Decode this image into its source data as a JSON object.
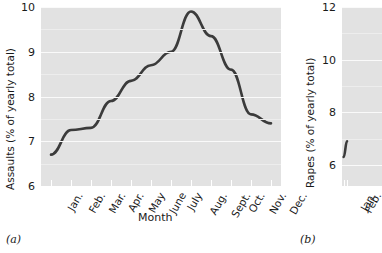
{
  "figure": {
    "background": "#ffffff",
    "plot_background": "#e2e2e2",
    "line_color": "#3b3b3b",
    "gridline_color": "#fafafa"
  },
  "panel_a": {
    "tag": "(a)",
    "ylabel": "Assaults (% of yearly total)",
    "xlabel": "Month",
    "ytick_labels": [
      "10",
      "9",
      "8",
      "7",
      "6"
    ],
    "xtick_labels": [
      "Jan.",
      "Feb.",
      "Mar.",
      "Apr.",
      "May",
      "June",
      "July",
      "Aug.",
      "Sept.",
      "Oct.",
      "Nov.",
      "Dec."
    ]
  },
  "panel_b": {
    "tag": "(b)",
    "ylabel": "Rapes (% of yearly total)",
    "ytick_labels": [
      "12",
      "10",
      "8",
      "6"
    ],
    "xtick_labels": [
      "Jan.",
      "Feb."
    ]
  },
  "chart_data": [
    {
      "type": "line",
      "panel": "(a)",
      "title": "",
      "xlabel": "Month",
      "ylabel": "Assaults (% of yearly total)",
      "categories": [
        "Jan.",
        "Feb.",
        "Mar.",
        "Apr.",
        "May",
        "June",
        "July",
        "Aug.",
        "Sept.",
        "Oct.",
        "Nov.",
        "Dec."
      ],
      "values": [
        6.7,
        7.25,
        7.3,
        7.9,
        8.35,
        8.7,
        9.0,
        9.9,
        9.35,
        8.6,
        7.6,
        7.4
      ],
      "ylim": [
        6,
        10
      ],
      "ytick_values": [
        6,
        7,
        8,
        9,
        10
      ],
      "grid": true,
      "legend": "none",
      "series": [
        {
          "name": "Assaults",
          "values": [
            6.7,
            7.25,
            7.3,
            7.9,
            8.35,
            8.7,
            9.0,
            9.9,
            9.35,
            8.6,
            7.6,
            7.4
          ]
        }
      ]
    },
    {
      "type": "line",
      "panel": "(b)",
      "title": "",
      "xlabel": "",
      "ylabel": "Rapes (% of yearly total)",
      "categories": [
        "Jan.",
        "Feb."
      ],
      "values": [
        6.3,
        6.9
      ],
      "ylim": [
        5.2,
        12
      ],
      "ytick_values": [
        6,
        8,
        10,
        12
      ],
      "grid": true,
      "legend": "none",
      "note": "panel cropped at right edge of image",
      "series": [
        {
          "name": "Rapes",
          "values": [
            6.3,
            6.9
          ]
        }
      ]
    }
  ]
}
